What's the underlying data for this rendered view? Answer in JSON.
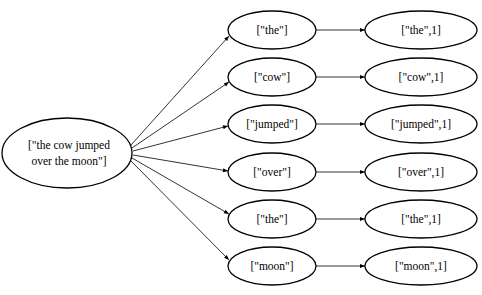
{
  "diagram": {
    "title": "",
    "input_node": {
      "line1": "[\"the cow jumped",
      "line2": "over the moon\"]"
    },
    "split_nodes": [
      {
        "label": "[\"the\"]"
      },
      {
        "label": "[\"cow\"]"
      },
      {
        "label": "[\"jumped\"]"
      },
      {
        "label": "[\"over\"]"
      },
      {
        "label": "[\"the\"]"
      },
      {
        "label": "[\"moon\"]"
      }
    ],
    "map_nodes": [
      {
        "label": "[\"the\",1]"
      },
      {
        "label": "[\"cow\",1]"
      },
      {
        "label": "[\"jumped\",1]"
      },
      {
        "label": "[\"over\",1]"
      },
      {
        "label": "[\"the\",1]"
      },
      {
        "label": "[\"moon\",1]"
      }
    ],
    "colors": {
      "stroke": "#000000",
      "fill": "#ffffff",
      "text": "#000000"
    }
  }
}
